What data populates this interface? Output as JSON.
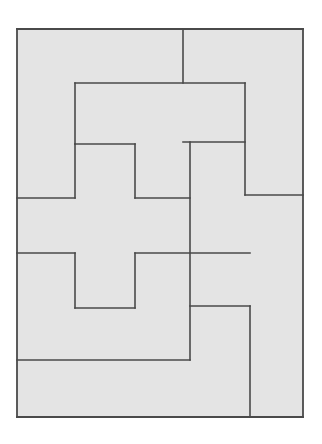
{
  "page": {
    "kind": "geometric-line-figure",
    "width": 322,
    "height": 444,
    "background_color": "#ffffff"
  },
  "figure": {
    "name": "rectangle-partition",
    "outer_rect": {
      "x": 17,
      "y": 29,
      "width": 286,
      "height": 388
    },
    "fill_color": "#e4e4e4",
    "stroke_color": "#4a4a4a",
    "stroke_width": 1.6,
    "outer_stroke_width": 1.8,
    "piece_count": 6,
    "pieces": [
      {
        "id": "piece-left-top",
        "label": "Left upper L piece",
        "points": "17,29 183,29 183,83 75,83 75,144 17,144"
      },
      {
        "id": "piece-right-top",
        "label": "Right upper piece",
        "points": "183,29 303,29 303,195 245,195 245,142 183,142"
      },
      {
        "id": "piece-upper-middle",
        "label": "Upper middle step piece",
        "points": "75,83 183,83 245,83 245,142 190,142 190,198 135,198 135,144 75,144"
      },
      {
        "id": "piece-center-cross",
        "label": "Central plus shaped piece",
        "points": "75,144 135,144 135,198 190,198 190,253 135,253 135,308 75,308 75,253 17,253 17,198 75,198"
      },
      {
        "id": "piece-right-middle",
        "label": "Right middle piece",
        "points": "190,142 245,142 245,195 250,195 250,306 192,306 192,253 190,253"
      },
      {
        "id": "piece-right-lower",
        "label": "Right lower piece",
        "points": "250,195 303,195 303,417 250,417"
      },
      {
        "id": "piece-bottom-left",
        "label": "Lower left piece",
        "points": "17,253 75,253 75,308 135,308 135,360 190,360 190,306 192,306 192,360 17,360"
      },
      {
        "id": "piece-bottom-strip",
        "label": "Bottom strip piece",
        "points": "17,360 250,360 250,417 17,417"
      }
    ],
    "segments": [
      {
        "id": "outer-top",
        "x1": 17,
        "y1": 29,
        "x2": 303,
        "y2": 29,
        "kind": "outer"
      },
      {
        "id": "outer-right",
        "x1": 303,
        "y1": 29,
        "x2": 303,
        "y2": 417,
        "kind": "outer"
      },
      {
        "id": "outer-bottom",
        "x1": 303,
        "y1": 417,
        "x2": 17,
        "y2": 417,
        "kind": "outer"
      },
      {
        "id": "outer-left",
        "x1": 17,
        "y1": 417,
        "x2": 17,
        "y2": 29,
        "kind": "outer"
      },
      {
        "id": "v-top-center",
        "x1": 183,
        "y1": 29,
        "x2": 183,
        "y2": 83,
        "kind": "inner"
      },
      {
        "id": "h-upper",
        "x1": 75,
        "y1": 83,
        "x2": 245,
        "y2": 83,
        "kind": "inner"
      },
      {
        "id": "v-upper-left",
        "x1": 75,
        "y1": 83,
        "x2": 75,
        "y2": 144,
        "kind": "inner"
      },
      {
        "id": "v-right-upper",
        "x1": 245,
        "y1": 83,
        "x2": 245,
        "y2": 195,
        "kind": "inner"
      },
      {
        "id": "h-cross-top",
        "x1": 75,
        "y1": 144,
        "x2": 135,
        "y2": 144,
        "kind": "inner"
      },
      {
        "id": "v-cross-upper-right",
        "x1": 135,
        "y1": 144,
        "x2": 135,
        "y2": 198,
        "kind": "inner"
      },
      {
        "id": "h-cross-arm-upper",
        "x1": 135,
        "y1": 198,
        "x2": 190,
        "y2": 198,
        "kind": "inner"
      },
      {
        "id": "v-mid-right",
        "x1": 190,
        "y1": 142,
        "x2": 190,
        "y2": 360,
        "kind": "inner"
      },
      {
        "id": "h-upper-right-step",
        "x1": 183,
        "y1": 142,
        "x2": 245,
        "y2": 142,
        "kind": "inner"
      },
      {
        "id": "h-right-divider",
        "x1": 245,
        "y1": 195,
        "x2": 303,
        "y2": 195,
        "kind": "inner"
      },
      {
        "id": "h-cross-left-top",
        "x1": 17,
        "y1": 198,
        "x2": 75,
        "y2": 198,
        "kind": "inner"
      },
      {
        "id": "v-cross-left",
        "x1": 75,
        "y1": 144,
        "x2": 75,
        "y2": 198,
        "kind": "inner"
      },
      {
        "id": "h-cross-left-bottom",
        "x1": 17,
        "y1": 253,
        "x2": 75,
        "y2": 253,
        "kind": "inner"
      },
      {
        "id": "h-cross-arm-lower",
        "x1": 135,
        "y1": 253,
        "x2": 250,
        "y2": 253,
        "kind": "inner"
      },
      {
        "id": "v-cross-lower-left",
        "x1": 75,
        "y1": 253,
        "x2": 75,
        "y2": 308,
        "kind": "inner"
      },
      {
        "id": "h-cross-bottom",
        "x1": 75,
        "y1": 308,
        "x2": 135,
        "y2": 308,
        "kind": "inner"
      },
      {
        "id": "v-cross-lower-right",
        "x1": 135,
        "y1": 253,
        "x2": 135,
        "y2": 308,
        "kind": "inner"
      },
      {
        "id": "h-lower-right-step",
        "x1": 190,
        "y1": 306,
        "x2": 250,
        "y2": 306,
        "kind": "inner"
      },
      {
        "id": "v-lower-right",
        "x1": 250,
        "y1": 306,
        "x2": 250,
        "y2": 417,
        "kind": "inner"
      },
      {
        "id": "h-bottom-strip",
        "x1": 17,
        "y1": 360,
        "x2": 190,
        "y2": 360,
        "kind": "inner"
      }
    ]
  }
}
